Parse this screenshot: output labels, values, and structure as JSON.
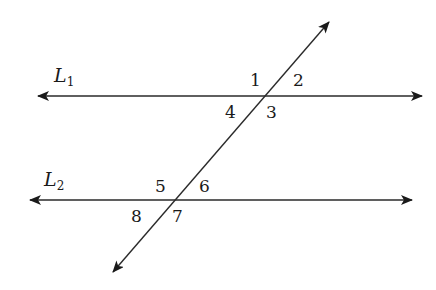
{
  "diagram": {
    "stroke_color": "#2a2a2a",
    "lines": [
      {
        "id": "L1",
        "name": "L",
        "subscript": "1",
        "y": 96,
        "x1": 38,
        "x2": 422,
        "label_x": 54,
        "label_y": 66
      },
      {
        "id": "L2",
        "name": "L",
        "subscript": "2",
        "y": 200,
        "x1": 30,
        "x2": 412,
        "label_x": 44,
        "label_y": 170
      }
    ],
    "transversal": {
      "x1": 329,
      "y1": 22,
      "x2": 113,
      "y2": 272
    },
    "angles": [
      {
        "label": "1",
        "x": 250,
        "y": 72
      },
      {
        "label": "2",
        "x": 293,
        "y": 72
      },
      {
        "label": "3",
        "x": 266,
        "y": 104
      },
      {
        "label": "4",
        "x": 225,
        "y": 104
      },
      {
        "label": "5",
        "x": 155,
        "y": 178
      },
      {
        "label": "6",
        "x": 199,
        "y": 178
      },
      {
        "label": "7",
        "x": 172,
        "y": 208
      },
      {
        "label": "8",
        "x": 131,
        "y": 208
      }
    ]
  }
}
